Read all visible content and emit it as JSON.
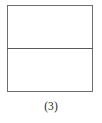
{
  "figure": {
    "caption": "(3)",
    "background_color": "#ffffff",
    "shape": {
      "kind": "rectangle-divided-horizontally",
      "outline_color": "#6e6e6e",
      "fill_color": "#ffffff",
      "divider_color": "#5a5a5a",
      "region_count": 2,
      "regions": [
        {
          "label": "",
          "position": "upper"
        },
        {
          "label": "",
          "position": "lower"
        }
      ]
    }
  }
}
